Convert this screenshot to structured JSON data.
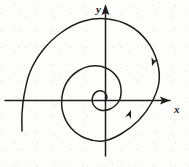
{
  "figure": {
    "background_color": "#fdfdfc",
    "ink_color": "#1a1a1a",
    "width": 189,
    "height": 167
  },
  "axes": {
    "x_axis": {
      "label": "x",
      "label_x": 176,
      "label_y": 112,
      "start": [
        5,
        100
      ],
      "end": [
        172,
        100
      ],
      "arrow": "right"
    },
    "y_axis": {
      "label": "y",
      "label_x": 96,
      "label_y": 12,
      "start": [
        105,
        156
      ],
      "end": [
        105,
        6
      ],
      "arrow": "up"
    },
    "origin": [
      105,
      100
    ],
    "stroke_width": 1.4
  },
  "chart_data": {
    "type": "line",
    "xlabel": "x",
    "ylabel": "y",
    "grid": false,
    "legend": null,
    "direction": "clockwise-inward",
    "arrowheads_on_curve": [
      {
        "x": 152,
        "y": 66,
        "angle_deg": 108
      },
      {
        "x": 131,
        "y": 110,
        "angle_deg": 290
      }
    ],
    "polar_spiral": {
      "center": [
        105,
        100
      ],
      "theta_start_deg": 152,
      "theta_turns": 2.35,
      "r_start": 84,
      "r_end": 5,
      "decay": "exponential"
    },
    "sampled_points": [
      [
        22,
        131
      ],
      [
        22,
        114
      ],
      [
        24,
        96
      ],
      [
        30,
        72
      ],
      [
        43,
        50
      ],
      [
        62,
        32
      ],
      [
        84,
        21
      ],
      [
        108,
        19
      ],
      [
        130,
        26
      ],
      [
        147,
        41
      ],
      [
        157,
        61
      ],
      [
        159,
        82
      ],
      [
        152,
        102
      ],
      [
        139,
        120
      ],
      [
        121,
        134
      ],
      [
        103,
        141
      ],
      [
        85,
        138
      ],
      [
        71,
        128
      ],
      [
        63,
        113
      ],
      [
        62,
        97
      ],
      [
        67,
        82
      ],
      [
        78,
        71
      ],
      [
        92,
        66
      ],
      [
        106,
        68
      ],
      [
        117,
        77
      ],
      [
        121,
        89
      ],
      [
        119,
        101
      ],
      [
        110,
        109
      ],
      [
        100,
        110
      ],
      [
        93,
        104
      ],
      [
        93,
        96
      ],
      [
        98,
        91
      ],
      [
        104,
        92
      ],
      [
        107,
        97
      ],
      [
        105,
        101
      ]
    ]
  },
  "curve": {
    "stroke_color": "#1f1f1f",
    "stroke_width": 1.5,
    "fill": "none"
  }
}
